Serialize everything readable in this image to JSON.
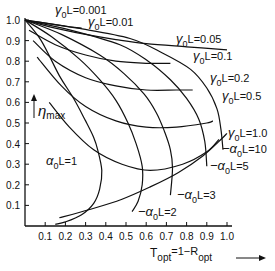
{
  "chart_data": {
    "type": "line",
    "title": "",
    "xlabel": "T_opt = 1 - R_opt",
    "ylabel": "η_max",
    "xlim": [
      0,
      1.0
    ],
    "ylim": [
      0,
      1.0
    ],
    "grid": false,
    "x_ticks": [
      "0.1",
      "0.2",
      "0.3",
      "0.4",
      "0.5",
      "0.6",
      "0.7",
      "0.8",
      "0.9",
      "1.0"
    ],
    "y_ticks": [
      "0.1",
      "0.2",
      "0.3",
      "0.4",
      "0.5",
      "0.6",
      "0.7",
      "0.8",
      "0.9",
      "1.0"
    ],
    "alpha_series": [
      {
        "name": "α0L=1",
        "label": "α₀L=1",
        "points": [
          [
            0,
            1.0
          ],
          [
            0.08,
            0.9
          ],
          [
            0.17,
            0.73
          ],
          [
            0.24,
            0.62
          ],
          [
            0.3,
            0.51
          ],
          [
            0.34,
            0.43
          ],
          [
            0.36,
            0.37
          ],
          [
            0.38,
            0.27
          ],
          [
            0.37,
            0.18
          ],
          [
            0.34,
            0.11
          ],
          [
            0.28,
            0.055
          ],
          [
            0.2,
            0.02
          ],
          [
            0.15,
            0.008
          ]
        ]
      },
      {
        "name": "α0L=2",
        "label": "α₀L=2",
        "points": [
          [
            0,
            1.0
          ],
          [
            0.13,
            0.92
          ],
          [
            0.27,
            0.81
          ],
          [
            0.37,
            0.71
          ],
          [
            0.45,
            0.61
          ],
          [
            0.51,
            0.5
          ],
          [
            0.55,
            0.4
          ],
          [
            0.58,
            0.29
          ],
          [
            0.58,
            0.2
          ],
          [
            0.56,
            0.12
          ],
          [
            0.53,
            0.07
          ]
        ]
      },
      {
        "name": "α0L=3",
        "label": "α₀L=3",
        "points": [
          [
            0,
            1.0
          ],
          [
            0.18,
            0.93
          ],
          [
            0.37,
            0.83
          ],
          [
            0.49,
            0.74
          ],
          [
            0.59,
            0.64
          ],
          [
            0.65,
            0.55
          ],
          [
            0.69,
            0.46
          ],
          [
            0.72,
            0.37
          ],
          [
            0.73,
            0.28
          ],
          [
            0.72,
            0.15
          ]
        ]
      },
      {
        "name": "α0L=5",
        "label": "α₀L=5",
        "points": [
          [
            0,
            1.0
          ],
          [
            0.23,
            0.95
          ],
          [
            0.47,
            0.88
          ],
          [
            0.61,
            0.8
          ],
          [
            0.72,
            0.71
          ],
          [
            0.8,
            0.62
          ],
          [
            0.86,
            0.52
          ],
          [
            0.89,
            0.41
          ],
          [
            0.9,
            0.29
          ]
        ]
      },
      {
        "name": "α0L=10",
        "label": "α₀L=10",
        "points": [
          [
            0,
            1.0
          ],
          [
            0.26,
            0.96
          ],
          [
            0.52,
            0.91
          ],
          [
            0.68,
            0.84
          ],
          [
            0.82,
            0.76
          ],
          [
            0.9,
            0.67
          ],
          [
            0.95,
            0.57
          ],
          [
            0.97,
            0.47
          ],
          [
            0.98,
            0.37
          ]
        ]
      }
    ],
    "gamma_series": [
      {
        "name": "γ0L=0.001",
        "label": "γ₀L=0.001",
        "points": [
          [
            0,
            1.0
          ],
          [
            0.1,
            0.985
          ],
          [
            0.2,
            0.97
          ],
          [
            0.28,
            0.96
          ]
        ]
      },
      {
        "name": "γ0L=0.01",
        "label": "γ₀L=0.01",
        "points": [
          [
            0,
            1.0
          ],
          [
            0.15,
            0.96
          ],
          [
            0.3,
            0.93
          ],
          [
            0.45,
            0.905
          ],
          [
            0.6,
            0.885
          ],
          [
            0.8,
            0.87
          ],
          [
            1.0,
            0.855
          ]
        ]
      },
      {
        "name": "γ0L=0.05",
        "label": "γ₀L=0.05",
        "points": [
          [
            0.02,
            0.95
          ],
          [
            0.15,
            0.88
          ],
          [
            0.3,
            0.83
          ],
          [
            0.45,
            0.8
          ],
          [
            0.6,
            0.79
          ],
          [
            0.72,
            0.79
          ]
        ]
      },
      {
        "name": "γ0L=0.1",
        "label": "γ₀L=0.1",
        "points": [
          [
            0.04,
            0.9
          ],
          [
            0.15,
            0.8
          ],
          [
            0.3,
            0.72
          ],
          [
            0.45,
            0.68
          ],
          [
            0.6,
            0.66
          ],
          [
            0.75,
            0.66
          ],
          [
            0.83,
            0.66
          ]
        ]
      },
      {
        "name": "γ0L=0.2",
        "label": "γ₀L=0.2",
        "points": [
          [
            0.06,
            0.82
          ],
          [
            0.18,
            0.68
          ],
          [
            0.3,
            0.58
          ],
          [
            0.45,
            0.51
          ],
          [
            0.6,
            0.48
          ],
          [
            0.75,
            0.48
          ],
          [
            0.9,
            0.5
          ],
          [
            0.93,
            0.51
          ]
        ]
      },
      {
        "name": "γ0L=0.5",
        "label": "γ₀L=0.5",
        "points": [
          [
            0.12,
            0.6
          ],
          [
            0.22,
            0.48
          ],
          [
            0.34,
            0.37
          ],
          [
            0.48,
            0.3
          ],
          [
            0.62,
            0.27
          ],
          [
            0.78,
            0.3
          ],
          [
            0.9,
            0.36
          ],
          [
            0.96,
            0.42
          ]
        ]
      },
      {
        "name": "γ0L=1.0",
        "label": "γ₀L=1.0",
        "points": [
          [
            0.17,
            0.04
          ],
          [
            0.32,
            0.08
          ],
          [
            0.48,
            0.13
          ],
          [
            0.62,
            0.19
          ],
          [
            0.76,
            0.26
          ],
          [
            0.88,
            0.34
          ],
          [
            0.97,
            0.42
          ],
          [
            1.0,
            0.45
          ]
        ]
      }
    ]
  },
  "labels": {
    "gamma": [
      {
        "text_sym": "γ",
        "sub": "0",
        "rest": "L=0.001",
        "x": 55,
        "y": 14
      },
      {
        "text_sym": "γ",
        "sub": "0",
        "rest": "L=0.01",
        "x": 88,
        "y": 26
      },
      {
        "text_sym": "γ",
        "sub": "0",
        "rest": "L=0.05",
        "x": 176,
        "y": 43
      },
      {
        "text_sym": "γ",
        "sub": "0",
        "rest": "L=0.1",
        "x": 193,
        "y": 60
      },
      {
        "text_sym": "γ",
        "sub": "0",
        "rest": "L=0.2",
        "x": 210,
        "y": 82
      },
      {
        "text_sym": "γ",
        "sub": "0",
        "rest": "L=0.5",
        "x": 222,
        "y": 100
      },
      {
        "text_sym": "γ",
        "sub": "0",
        "rest": "L=1.0",
        "x": 228,
        "y": 137
      }
    ],
    "alpha": [
      {
        "text_sym": "α",
        "sub": "0",
        "rest": "L=1",
        "x": 46,
        "y": 165
      },
      {
        "text_sym": "−α",
        "sub": "0",
        "rest": "L=10",
        "x": 222,
        "y": 153
      },
      {
        "text_sym": "−α",
        "sub": "0",
        "rest": "L=5",
        "x": 210,
        "y": 170
      },
      {
        "text_sym": "−α",
        "sub": "0",
        "rest": "L=3",
        "x": 177,
        "y": 199
      },
      {
        "text_sym": "−α",
        "sub": "0",
        "rest": "L=2",
        "x": 138,
        "y": 216
      }
    ],
    "y_axis_label": {
      "sym": "η",
      "sub": "max"
    },
    "x_axis_label": {
      "t": "T",
      "t_sub": "opt",
      "mid": "=1−R",
      "r_sub": "opt"
    }
  }
}
